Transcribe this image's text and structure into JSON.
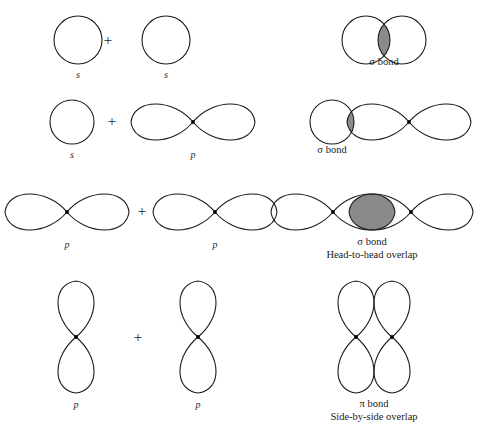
{
  "figure": {
    "background_color": "#ffffff",
    "stroke_color": "#1a1a1a",
    "overlap_fill_color": "#8a8a8a",
    "nucleus_color": "#000000",
    "plus_sign": "+"
  },
  "rows": [
    {
      "id": "row-s-plus-s",
      "left": {
        "orbital_a": {
          "type": "s",
          "label": "s"
        },
        "operator": "+",
        "orbital_b": {
          "type": "s",
          "label": "s"
        }
      },
      "right": {
        "result": {
          "bond_type": "sigma",
          "overlap_count": 1
        },
        "caption_line1": "σ bond",
        "caption_line2": ""
      }
    },
    {
      "id": "row-s-plus-p",
      "left": {
        "orbital_a": {
          "type": "s",
          "label": "s"
        },
        "operator": "+",
        "orbital_b": {
          "type": "p",
          "label": "p",
          "orientation": "horizontal"
        }
      },
      "right": {
        "result": {
          "bond_type": "sigma",
          "overlap_count": 1
        },
        "caption_line1": "σ bond",
        "caption_line2": ""
      }
    },
    {
      "id": "row-p-plus-p-head",
      "left": {
        "orbital_a": {
          "type": "p",
          "label": "p",
          "orientation": "horizontal"
        },
        "operator": "+",
        "orbital_b": {
          "type": "p",
          "label": "p",
          "orientation": "horizontal"
        }
      },
      "right": {
        "result": {
          "bond_type": "sigma",
          "overlap_count": 1
        },
        "caption_line1": "σ bond",
        "caption_line2": "Head-to-head overlap"
      }
    },
    {
      "id": "row-p-plus-p-side",
      "left": {
        "orbital_a": {
          "type": "p",
          "label": "p",
          "orientation": "vertical"
        },
        "operator": "+",
        "orbital_b": {
          "type": "p",
          "label": "p",
          "orientation": "vertical"
        }
      },
      "right": {
        "result": {
          "bond_type": "pi",
          "overlap_count": 2
        },
        "caption_line1": "π bond",
        "caption_line2": "Side-by-side overlap"
      }
    }
  ]
}
